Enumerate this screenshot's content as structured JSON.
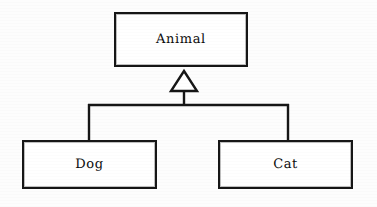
{
  "diagram": {
    "type": "uml-class-diagram",
    "relationship": "generalization",
    "background_color": "#fdfdfd",
    "line_color": "#161616",
    "fill_color": "#ffffff",
    "classes": [
      {
        "id": "animal",
        "name": "Animal",
        "role": "superclass",
        "x": 114,
        "y": 12,
        "width": 134,
        "height": 55
      },
      {
        "id": "dog",
        "name": "Dog",
        "role": "subclass",
        "x": 22,
        "y": 140,
        "width": 135,
        "height": 49
      },
      {
        "id": "cat",
        "name": "Cat",
        "role": "subclass",
        "x": 218,
        "y": 140,
        "width": 135,
        "height": 49
      }
    ],
    "arrowhead": {
      "kind": "hollow-triangle",
      "apex_x": 184,
      "apex_y": 71,
      "base_y": 91,
      "left_x": 172,
      "right_x": 196
    },
    "connector": {
      "stem_x": 184,
      "stem_top": 91,
      "bar_y": 105,
      "bar_left_x": 89,
      "bar_right_x": 288,
      "drop_bottom_y": 140
    }
  }
}
